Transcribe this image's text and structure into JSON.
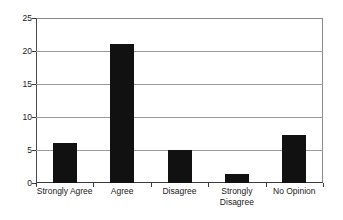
{
  "chart_data": {
    "type": "bar",
    "title": "",
    "subtitle": "",
    "xlabel": "",
    "ylabel": "",
    "categories": [
      "Strongly Agree",
      "Agree",
      "Disagree",
      "Strongly\nDisagree",
      "No Opinion"
    ],
    "values": [
      6,
      21,
      5,
      1.3,
      7.3
    ],
    "ylim": [
      0,
      25
    ],
    "yticks": [
      0,
      5,
      10,
      15,
      20,
      25
    ],
    "ytick_labels": [
      "0",
      "5",
      "10",
      "15",
      "20",
      "25"
    ],
    "grid": true,
    "grid_axis": "y",
    "legend": false,
    "legend_position": "none",
    "series": [
      {
        "name": "Responses",
        "values": [
          6,
          21,
          5,
          1.3,
          7.3
        ],
        "color": "#111111"
      }
    ]
  },
  "style": {
    "bar_color": "#111111",
    "grid_color": "#9a9a9a",
    "axis_color": "#3a3a3a",
    "background": "#ffffff",
    "text_color": "#1a1a1a"
  }
}
